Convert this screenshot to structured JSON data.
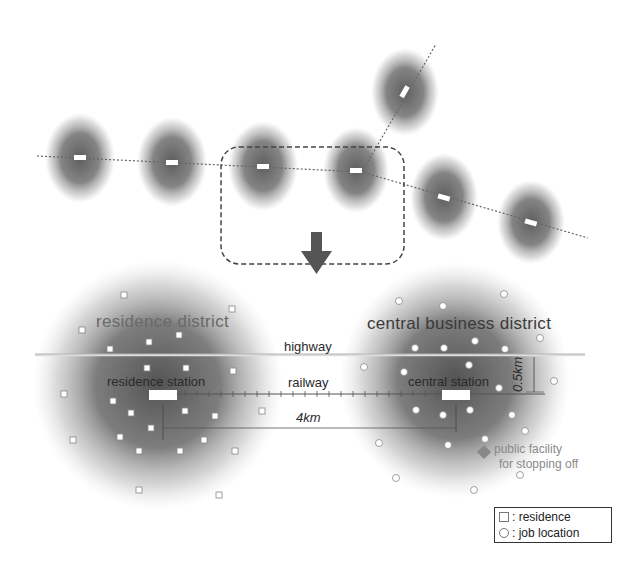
{
  "top_network": {
    "description": "railway line with station-centered urban areas",
    "stations": [
      {
        "x": 80,
        "y": 158
      },
      {
        "x": 172,
        "y": 162
      },
      {
        "x": 263,
        "y": 166
      },
      {
        "x": 356,
        "y": 170
      },
      {
        "x": 444,
        "y": 197
      },
      {
        "x": 531,
        "y": 222
      },
      {
        "x": 405,
        "y": 92
      }
    ],
    "focus_box": "dashed-rounded-rectangle"
  },
  "arrow": "down-arrow",
  "labels": {
    "residence_district": "residence district",
    "central_business_district": "central business district",
    "highway": "highway",
    "railway": "railway",
    "residence_station": "residence station",
    "central_station": "central station",
    "distance_horizontal": "4km",
    "distance_vertical": "0.5km",
    "facility_line1": "public facility",
    "facility_line2": "for stopping off"
  },
  "legend": {
    "items": [
      {
        "symbol": "square",
        "label": ": residence"
      },
      {
        "symbol": "circle",
        "label": ": job location"
      }
    ]
  },
  "colors": {
    "blob": "#555555",
    "line": "#666666",
    "station": "#ffffff",
    "facility": "#888888"
  }
}
